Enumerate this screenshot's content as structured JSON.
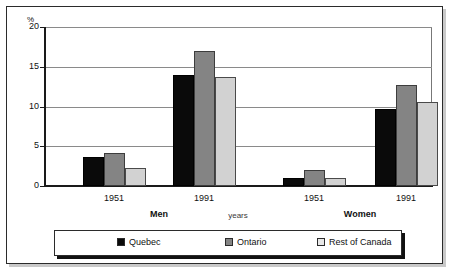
{
  "chart_data": {
    "type": "bar",
    "title": "",
    "subtitle": "",
    "xlabel": "years",
    "ylabel": "%",
    "ylim": [
      0,
      20
    ],
    "yticks": [
      0,
      5,
      10,
      15,
      20
    ],
    "ytick_labels": [
      "0",
      "5",
      "10",
      "15",
      "20"
    ],
    "grid": true,
    "legend_position": "bottom",
    "panels": [
      {
        "label": "Men",
        "categories": [
          "1951",
          "1991"
        ]
      },
      {
        "label": "Women",
        "categories": [
          "1951",
          "1991"
        ]
      }
    ],
    "categories": [
      "Men 1951",
      "Men 1991",
      "Women 1951",
      "Women 1991"
    ],
    "series": [
      {
        "name": "Quebec",
        "color": "#0a0a0a",
        "values": [
          3.7,
          13.9,
          1.0,
          9.7
        ]
      },
      {
        "name": "Ontario",
        "color": "#848484",
        "values": [
          4.2,
          17.0,
          2.0,
          12.7
        ]
      },
      {
        "name": "Rest of Canada",
        "color": "#d2d2d2",
        "values": [
          2.3,
          13.7,
          1.0,
          10.6
        ]
      }
    ]
  },
  "legend": {
    "items": [
      {
        "label": "Quebec"
      },
      {
        "label": "Ontario"
      },
      {
        "label": "Rest of Canada"
      }
    ]
  },
  "axis": {
    "y_unit": "%",
    "x_title": "years"
  }
}
